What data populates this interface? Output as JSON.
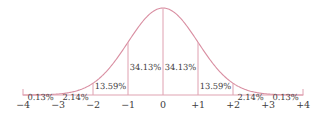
{
  "chart_data": {
    "type": "area",
    "title": "",
    "subtitle": "",
    "xlabel": "",
    "ylabel": "",
    "xlim": [
      -4,
      4
    ],
    "ylim": [
      0,
      1
    ],
    "grid": false,
    "legend": "none",
    "curve": "standard normal distribution (bell curve)",
    "x_tick_labels": [
      "−4",
      "−3",
      "−2",
      "−1",
      "0",
      "+1",
      "+2",
      "+3",
      "+4"
    ],
    "x_tick_values": [
      -4,
      -3,
      -2,
      -1,
      0,
      1,
      2,
      3,
      4
    ],
    "categories": [
      "−4 to −3",
      "−3 to −2",
      "−2 to −1",
      "−1 to 0",
      "0 to +1",
      "+1 to +2",
      "+2 to +3",
      "+3 to +4"
    ],
    "values": [
      0.13,
      2.14,
      13.59,
      34.13,
      34.13,
      13.59,
      2.14,
      0.13
    ],
    "value_labels": [
      "0.13%",
      "2.14%",
      "13.59%",
      "34.13%",
      "34.13%",
      "13.59%",
      "2.14%",
      "0.13%"
    ],
    "colors": {
      "curve": "#d98fa2",
      "divider": "#dfa0b0",
      "axis": "#e0a3b2",
      "text": "#444041",
      "tick_text": "#3d3a3b",
      "background": "#ffffff"
    }
  },
  "segments": [
    {
      "label": "0.13%",
      "center": -3.5,
      "label_y": 92
    },
    {
      "label": "2.14%",
      "center": -2.5,
      "label_y": 92
    },
    {
      "label": "13.59%",
      "center": -1.5,
      "label_y": 81
    },
    {
      "label": "34.13%",
      "center": -0.5,
      "label_y": 62
    },
    {
      "label": "34.13%",
      "center": 0.5,
      "label_y": 62
    },
    {
      "label": "13.59%",
      "center": 1.5,
      "label_y": 81
    },
    {
      "label": "2.14%",
      "center": 2.5,
      "label_y": 92
    },
    {
      "label": "0.13%",
      "center": 3.5,
      "label_y": 92
    }
  ],
  "ticks": [
    {
      "label": "−4",
      "value": -4
    },
    {
      "label": "−3",
      "value": -3
    },
    {
      "label": "−2",
      "value": -2
    },
    {
      "label": "−1",
      "value": -1
    },
    {
      "label": "0",
      "value": 0
    },
    {
      "label": "+1",
      "value": 1
    },
    {
      "label": "+2",
      "value": 2
    },
    {
      "label": "+3",
      "value": 3
    },
    {
      "label": "+4",
      "value": 4
    }
  ]
}
